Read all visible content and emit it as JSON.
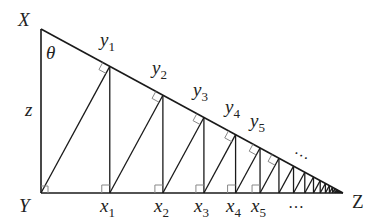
{
  "diagram": {
    "vertices": {
      "X": {
        "label": "X",
        "x": 41,
        "y": 29
      },
      "Y": {
        "label": "Y",
        "x": 41,
        "y": 193
      },
      "Z": {
        "label": "Z",
        "x": 343,
        "y": 193
      }
    },
    "angle_label": "θ",
    "side_label": "z",
    "x_points": [
      {
        "name": "x",
        "sub": "1"
      },
      {
        "name": "x",
        "sub": "2"
      },
      {
        "name": "x",
        "sub": "3"
      },
      {
        "name": "x",
        "sub": "4"
      },
      {
        "name": "x",
        "sub": "5"
      }
    ],
    "y_points": [
      {
        "name": "y",
        "sub": "1"
      },
      {
        "name": "y",
        "sub": "2"
      },
      {
        "name": "y",
        "sub": "3"
      },
      {
        "name": "y",
        "sub": "4"
      },
      {
        "name": "y",
        "sub": "5"
      }
    ],
    "ellipsis": "…",
    "line_color": "#1a1a1a",
    "marker_color": "#888888"
  }
}
